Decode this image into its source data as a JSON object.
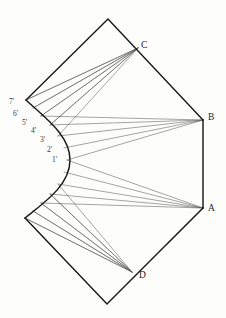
{
  "figure": {
    "background_color": "#fdfdfc",
    "outline_color": "#1a1a1a",
    "ray_color": "#5a5a5a",
    "label_color": "#242424",
    "canvas": {
      "width": 226,
      "height": 318
    }
  },
  "vertex_labels": [
    {
      "name": "C",
      "text": "C",
      "x": 141,
      "y": 41
    },
    {
      "name": "B",
      "text": "B",
      "x": 208,
      "y": 113
    },
    {
      "name": "A",
      "text": "A",
      "x": 208,
      "y": 204
    },
    {
      "name": "D",
      "text": "D",
      "x": 139,
      "y": 271
    }
  ],
  "tick_labels": [
    {
      "name": "7prime",
      "text": "7'",
      "x": 9,
      "y": 98
    },
    {
      "name": "6prime",
      "text": "6'",
      "x": 13,
      "y": 110
    },
    {
      "name": "5prime",
      "text": "5'",
      "x": 22,
      "y": 119
    },
    {
      "name": "4prime",
      "text": "4'",
      "x": 31,
      "y": 127
    },
    {
      "name": "3prime",
      "text": "3'",
      "x": 40,
      "y": 136
    },
    {
      "name": "2prime",
      "text": "2'",
      "x": 47,
      "y": 146
    },
    {
      "name": "1prime",
      "text": "1'",
      "x": 52,
      "y": 156
    }
  ],
  "geometry": {
    "points": {
      "top_apex": [
        108,
        19
      ],
      "left_upper": [
        26,
        100
      ],
      "left_lower": [
        25,
        218
      ],
      "bottom_apex": [
        107,
        304
      ],
      "A": [
        203,
        208
      ],
      "B": [
        203,
        120
      ],
      "C": [
        138,
        48
      ],
      "D": [
        132,
        272
      ]
    },
    "outline_upper": "M 26,100 L 108,19 L 203,120",
    "outline_lower": "M 25,218 L 107,304 L 203,208",
    "outline_right": "M 203,120 L 203,208",
    "arc_path": "M 26,100 C 45,118 70,135 70,160 C 70,185 45,202 25,218",
    "curve_nodes": [
      [
        26,
        100
      ],
      [
        33,
        108
      ],
      [
        41,
        116
      ],
      [
        50,
        125
      ],
      [
        58,
        136
      ],
      [
        64,
        148
      ],
      [
        67,
        160
      ]
    ],
    "lower_edge_nodes": [
      [
        25,
        218
      ],
      [
        33,
        211
      ],
      [
        41,
        203
      ],
      [
        50,
        194
      ],
      [
        58,
        184
      ],
      [
        64,
        172
      ],
      [
        67,
        160
      ]
    ],
    "fan_to_C": [
      [
        26,
        100
      ],
      [
        33,
        108
      ],
      [
        41,
        116
      ],
      [
        50,
        125
      ]
    ],
    "fan_to_B": [
      [
        41,
        116
      ],
      [
        50,
        125
      ],
      [
        58,
        136
      ],
      [
        64,
        148
      ],
      [
        67,
        160
      ]
    ],
    "fan_to_A": [
      [
        67,
        160
      ],
      [
        64,
        172
      ],
      [
        58,
        184
      ],
      [
        50,
        194
      ],
      [
        41,
        203
      ]
    ],
    "fan_to_D": [
      [
        50,
        194
      ],
      [
        41,
        203
      ],
      [
        33,
        211
      ],
      [
        25,
        218
      ]
    ]
  }
}
